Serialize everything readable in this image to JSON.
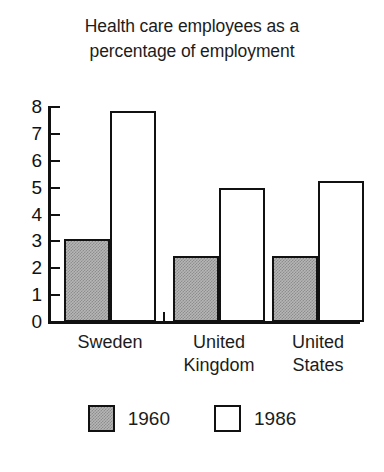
{
  "chart_data": {
    "type": "bar",
    "title": "Health care employees as a percentage of employment",
    "title_lines": [
      "Health care employees as a",
      "percentage of employment"
    ],
    "xlabel": "",
    "ylabel": "",
    "ylim": [
      0,
      8
    ],
    "yticks": [
      0,
      1,
      2,
      3,
      4,
      5,
      6,
      7,
      8
    ],
    "ytick_labels": [
      "0",
      "1",
      "2",
      "3",
      "4",
      "5",
      "6",
      "7",
      "8"
    ],
    "grid": false,
    "legend_position": "bottom",
    "categories": [
      "Sweden",
      "United Kingdom",
      "United States"
    ],
    "category_label_lines": [
      [
        "Sweden"
      ],
      [
        "United",
        "Kingdom"
      ],
      [
        "United",
        "States"
      ]
    ],
    "series": [
      {
        "name": "1960",
        "values": [
          3.1,
          2.45,
          2.45
        ],
        "color": "#b6b6b6"
      },
      {
        "name": "1986",
        "values": [
          7.85,
          5.0,
          5.25
        ],
        "color": "#ffffff"
      }
    ]
  },
  "legend": {
    "entries": [
      {
        "label": "1960"
      },
      {
        "label": "1986"
      }
    ]
  },
  "colors": {
    "ink": "#111111",
    "fill_1960": "#b6b6b6",
    "fill_1986": "#ffffff",
    "background": "#ffffff"
  }
}
